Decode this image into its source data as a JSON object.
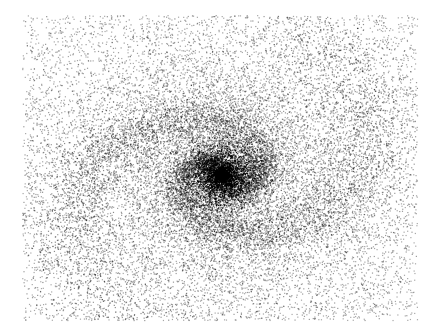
{
  "chart_data": {
    "type": "scatter",
    "title": "",
    "xlabel": "",
    "ylabel": "",
    "grid": false,
    "legend": null,
    "canvas": {
      "width": 437,
      "height": 331,
      "background": "#ffffff",
      "point_color": "#000000"
    },
    "plot_region": {
      "x0": 22,
      "y0": 15,
      "x1": 417,
      "y1": 320
    },
    "core": {
      "cx": 222,
      "cy": 175,
      "radius_px": 25,
      "points": 2600
    },
    "arms": [
      {
        "name": "arm-1",
        "start_angle_deg": -90,
        "turns": 1.35,
        "r0": 14,
        "growth": 0.42,
        "points": 5200,
        "spread_px": 7
      },
      {
        "name": "arm-2",
        "start_angle_deg": 90,
        "turns": 1.35,
        "r0": 14,
        "growth": 0.42,
        "points": 5200,
        "spread_px": 7
      }
    ],
    "halo": {
      "points": 9000,
      "sigma_x": 110,
      "sigma_y": 80
    },
    "background_noise": {
      "points": 5500
    },
    "aspect": {
      "sx": 1.35,
      "sy": 1.0
    },
    "seed": 7
  }
}
